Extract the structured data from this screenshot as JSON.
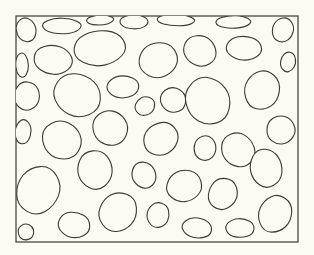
{
  "figure": {
    "background": "#fbfbf3",
    "stroke": "#3a3a36",
    "frame": {
      "x": 16,
      "y": 16,
      "w": 282,
      "h": 226
    },
    "cells": [
      {
        "cx": 26,
        "cy": 30,
        "rx": 12,
        "ry": 14
      },
      {
        "cx": 62,
        "cy": 26,
        "rx": 22,
        "ry": 10
      },
      {
        "cx": 100,
        "cy": 20,
        "rx": 16,
        "ry": 6
      },
      {
        "cx": 134,
        "cy": 22,
        "rx": 18,
        "ry": 8
      },
      {
        "cx": 176,
        "cy": 20,
        "rx": 22,
        "ry": 7
      },
      {
        "cx": 233,
        "cy": 22,
        "rx": 20,
        "ry": 8
      },
      {
        "cx": 283,
        "cy": 30,
        "rx": 13,
        "ry": 14
      },
      {
        "cx": 22,
        "cy": 65,
        "rx": 8,
        "ry": 14
      },
      {
        "cx": 53,
        "cy": 60,
        "rx": 22,
        "ry": 18
      },
      {
        "cx": 100,
        "cy": 48,
        "rx": 30,
        "ry": 22
      },
      {
        "cx": 158,
        "cy": 60,
        "rx": 24,
        "ry": 20
      },
      {
        "cx": 200,
        "cy": 51,
        "rx": 20,
        "ry": 18
      },
      {
        "cx": 244,
        "cy": 48,
        "rx": 20,
        "ry": 15
      },
      {
        "cx": 288,
        "cy": 62,
        "rx": 9,
        "ry": 12
      },
      {
        "cx": 27,
        "cy": 96,
        "rx": 16,
        "ry": 16
      },
      {
        "cx": 77,
        "cy": 95,
        "rx": 28,
        "ry": 26
      },
      {
        "cx": 123,
        "cy": 87,
        "rx": 18,
        "ry": 14
      },
      {
        "cx": 145,
        "cy": 106,
        "rx": 12,
        "ry": 11
      },
      {
        "cx": 173,
        "cy": 100,
        "rx": 16,
        "ry": 14
      },
      {
        "cx": 208,
        "cy": 101,
        "rx": 26,
        "ry": 29
      },
      {
        "cx": 262,
        "cy": 90,
        "rx": 20,
        "ry": 24
      },
      {
        "cx": 23,
        "cy": 132,
        "rx": 10,
        "ry": 14
      },
      {
        "cx": 62,
        "cy": 140,
        "rx": 24,
        "ry": 22
      },
      {
        "cx": 110,
        "cy": 128,
        "rx": 20,
        "ry": 22
      },
      {
        "cx": 161,
        "cy": 139,
        "rx": 20,
        "ry": 20
      },
      {
        "cx": 205,
        "cy": 148,
        "rx": 14,
        "ry": 14
      },
      {
        "cx": 238,
        "cy": 150,
        "rx": 20,
        "ry": 20
      },
      {
        "cx": 281,
        "cy": 130,
        "rx": 16,
        "ry": 18
      },
      {
        "cx": 38,
        "cy": 190,
        "rx": 26,
        "ry": 28
      },
      {
        "cx": 95,
        "cy": 170,
        "rx": 22,
        "ry": 22
      },
      {
        "cx": 144,
        "cy": 175,
        "rx": 14,
        "ry": 16
      },
      {
        "cx": 184,
        "cy": 186,
        "rx": 20,
        "ry": 20
      },
      {
        "cx": 223,
        "cy": 194,
        "rx": 18,
        "ry": 18
      },
      {
        "cx": 266,
        "cy": 168,
        "rx": 20,
        "ry": 22
      },
      {
        "cx": 74,
        "cy": 225,
        "rx": 18,
        "ry": 16
      },
      {
        "cx": 118,
        "cy": 212,
        "rx": 22,
        "ry": 24
      },
      {
        "cx": 158,
        "cy": 215,
        "rx": 14,
        "ry": 14
      },
      {
        "cx": 197,
        "cy": 228,
        "rx": 18,
        "ry": 12
      },
      {
        "cx": 240,
        "cy": 228,
        "rx": 16,
        "ry": 12
      },
      {
        "cx": 275,
        "cy": 214,
        "rx": 20,
        "ry": 22
      },
      {
        "cx": 26,
        "cy": 232,
        "rx": 10,
        "ry": 9
      }
    ]
  }
}
